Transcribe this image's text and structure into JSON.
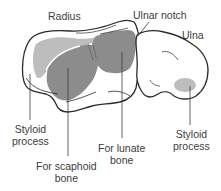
{
  "figure": {
    "colors": {
      "outline": "#2a2a2a",
      "bone_fill": "#ffffff",
      "articular_dark": "#8c8c8c",
      "articular_light": "#bdbdbd",
      "leader_line": "#3a3a3a",
      "text": "#3c3c3c"
    }
  },
  "labels": {
    "radius": {
      "text": "Radius"
    },
    "ulnar_notch": {
      "text": "Ulnar notch"
    },
    "ulna": {
      "text": "Ulna"
    },
    "styloid_radius": {
      "line1": "Styloid",
      "line2": "process"
    },
    "scaphoid": {
      "line1": "For scaphoid",
      "line2": "bone"
    },
    "lunate": {
      "line1": "For lunate",
      "line2": "bone"
    },
    "styloid_ulna": {
      "line1": "Styloid",
      "line2": "process"
    }
  }
}
